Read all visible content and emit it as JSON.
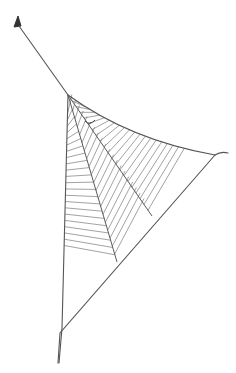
{
  "image": {
    "subject": "Hand-drawn sketch of a triangular spider web",
    "background": "#ffffff",
    "ink_color": "#555555",
    "stripe_color": "#8a8a8a"
  },
  "web": {
    "anchor": {
      "x": 17,
      "y": 24
    },
    "hub": {
      "x": 68,
      "y": 95
    },
    "right_corner": {
      "x": 215,
      "y": 155
    },
    "right_tail": {
      "x": 228,
      "y": 153
    },
    "bottom_tip": {
      "x": 58,
      "y": 363
    },
    "left_bottom": {
      "x": 62,
      "y": 358
    },
    "radials": [
      {
        "name": "inner",
        "end": {
          "x": 117,
          "y": 262
        }
      },
      {
        "name": "middle",
        "end": {
          "x": 152,
          "y": 216
        }
      }
    ],
    "spider_mark": {
      "x": 90,
      "y": 123
    }
  }
}
